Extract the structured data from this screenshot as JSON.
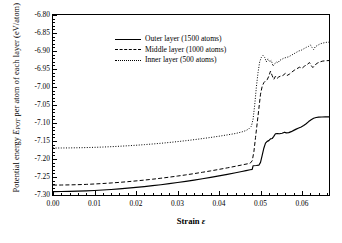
{
  "chart_data": {
    "type": "line",
    "title": "",
    "xlabel": "Strain ε",
    "ylabel": "Potential energy E_POT per atom of each layer (eV/atom)",
    "ylabel_main": "Potential energy ",
    "ylabel_sym": "E",
    "ylabel_sub": "POT",
    "ylabel_tail": " per atom of each layer (eV/atom)",
    "xlabel_main": "Strain ",
    "xlabel_sym": "ε",
    "xlim": [
      0.0,
      0.0665
    ],
    "ylim": [
      -7.3,
      -6.8
    ],
    "grid": false,
    "legend_position": "top-left",
    "x_ticks": [
      "0.00",
      "0.01",
      "0.02",
      "0.03",
      "0.04",
      "0.05",
      "0.06"
    ],
    "x_tick_values": [
      0.0,
      0.01,
      0.02,
      0.03,
      0.04,
      0.05,
      0.06
    ],
    "x_minor_step": 0.002,
    "y_ticks": [
      "-6.80",
      "-6.85",
      "-6.90",
      "-6.95",
      "-7.00",
      "-7.05",
      "-7.10",
      "-7.15",
      "-7.20",
      "-7.25",
      "-7.30"
    ],
    "y_tick_values": [
      -6.8,
      -6.85,
      -6.9,
      -6.95,
      -7.0,
      -7.05,
      -7.1,
      -7.15,
      -7.2,
      -7.25,
      -7.3
    ],
    "y_minor_step": 0.01,
    "series": [
      {
        "name": "Outer layer (1500 atoms)",
        "style": "solid",
        "color": "#000000",
        "points": [
          [
            0.0,
            -7.2905
          ],
          [
            0.002,
            -7.2903
          ],
          [
            0.004,
            -7.2899
          ],
          [
            0.006,
            -7.2893
          ],
          [
            0.008,
            -7.2885
          ],
          [
            0.01,
            -7.2874
          ],
          [
            0.012,
            -7.2861
          ],
          [
            0.014,
            -7.2846
          ],
          [
            0.016,
            -7.2829
          ],
          [
            0.018,
            -7.281
          ],
          [
            0.02,
            -7.2789
          ],
          [
            0.022,
            -7.2766
          ],
          [
            0.024,
            -7.2741
          ],
          [
            0.026,
            -7.2714
          ],
          [
            0.028,
            -7.2685
          ],
          [
            0.03,
            -7.2654
          ],
          [
            0.032,
            -7.2621
          ],
          [
            0.034,
            -7.2586
          ],
          [
            0.036,
            -7.2549
          ],
          [
            0.038,
            -7.251
          ],
          [
            0.04,
            -7.2469
          ],
          [
            0.042,
            -7.2426
          ],
          [
            0.044,
            -7.2381
          ],
          [
            0.0455,
            -7.2346
          ],
          [
            0.0465,
            -7.2322
          ],
          [
            0.0475,
            -7.2299
          ],
          [
            0.048,
            -7.2287
          ],
          [
            0.0482,
            -7.2188
          ],
          [
            0.049,
            -7.218
          ],
          [
            0.0496,
            -7.2172
          ],
          [
            0.05,
            -7.2095
          ],
          [
            0.0504,
            -7.19
          ],
          [
            0.0508,
            -7.17
          ],
          [
            0.0512,
            -7.156
          ],
          [
            0.0516,
            -7.151
          ],
          [
            0.052,
            -7.149
          ],
          [
            0.0524,
            -7.144
          ],
          [
            0.0528,
            -7.1432
          ],
          [
            0.0532,
            -7.137
          ],
          [
            0.0536,
            -7.13
          ],
          [
            0.054,
            -7.1292
          ],
          [
            0.0546,
            -7.13
          ],
          [
            0.0552,
            -7.1285
          ],
          [
            0.0558,
            -7.1255
          ],
          [
            0.0562,
            -7.1275
          ],
          [
            0.0568,
            -7.1268
          ],
          [
            0.0574,
            -7.124
          ],
          [
            0.058,
            -7.1205
          ],
          [
            0.0586,
            -7.117
          ],
          [
            0.0592,
            -7.114
          ],
          [
            0.0598,
            -7.111
          ],
          [
            0.0604,
            -7.107
          ],
          [
            0.061,
            -7.102
          ],
          [
            0.0616,
            -7.096
          ],
          [
            0.0622,
            -7.091
          ],
          [
            0.0628,
            -7.087
          ],
          [
            0.0634,
            -7.0848
          ],
          [
            0.064,
            -7.0838
          ],
          [
            0.0648,
            -7.0833
          ],
          [
            0.0656,
            -7.083
          ],
          [
            0.0665,
            -7.0828
          ]
        ]
      },
      {
        "name": "Middle layer (1000 atoms)",
        "style": "dashed",
        "color": "#000000",
        "points": [
          [
            0.0,
            -7.2725
          ],
          [
            0.002,
            -7.2723
          ],
          [
            0.004,
            -7.2719
          ],
          [
            0.006,
            -7.2713
          ],
          [
            0.008,
            -7.2705
          ],
          [
            0.01,
            -7.2694
          ],
          [
            0.012,
            -7.2681
          ],
          [
            0.014,
            -7.2666
          ],
          [
            0.016,
            -7.2649
          ],
          [
            0.018,
            -7.263
          ],
          [
            0.02,
            -7.2609
          ],
          [
            0.022,
            -7.2586
          ],
          [
            0.024,
            -7.2561
          ],
          [
            0.026,
            -7.2534
          ],
          [
            0.028,
            -7.2505
          ],
          [
            0.03,
            -7.2474
          ],
          [
            0.032,
            -7.2441
          ],
          [
            0.034,
            -7.2406
          ],
          [
            0.036,
            -7.2369
          ],
          [
            0.038,
            -7.233
          ],
          [
            0.04,
            -7.2289
          ],
          [
            0.042,
            -7.2246
          ],
          [
            0.044,
            -7.2201
          ],
          [
            0.0455,
            -7.2166
          ],
          [
            0.0465,
            -7.2142
          ],
          [
            0.0475,
            -7.2118
          ],
          [
            0.048,
            -7.205
          ],
          [
            0.0484,
            -7.18
          ],
          [
            0.0488,
            -7.14
          ],
          [
            0.0492,
            -7.1
          ],
          [
            0.0496,
            -7.06
          ],
          [
            0.05,
            -7.02
          ],
          [
            0.0504,
            -6.998
          ],
          [
            0.0508,
            -6.988
          ],
          [
            0.0512,
            -6.983
          ],
          [
            0.0516,
            -6.98
          ],
          [
            0.052,
            -6.97
          ],
          [
            0.0524,
            -6.956
          ],
          [
            0.0528,
            -6.968
          ],
          [
            0.0532,
            -6.979
          ],
          [
            0.0536,
            -6.97
          ],
          [
            0.054,
            -6.976
          ],
          [
            0.0544,
            -6.972
          ],
          [
            0.0548,
            -6.97
          ],
          [
            0.0554,
            -6.968
          ],
          [
            0.056,
            -6.962
          ],
          [
            0.0564,
            -6.968
          ],
          [
            0.057,
            -6.964
          ],
          [
            0.0576,
            -6.958
          ],
          [
            0.0582,
            -6.953
          ],
          [
            0.0588,
            -6.949
          ],
          [
            0.0594,
            -6.945
          ],
          [
            0.06,
            -6.948
          ],
          [
            0.0606,
            -6.942
          ],
          [
            0.0612,
            -6.938
          ],
          [
            0.0618,
            -6.932
          ],
          [
            0.0622,
            -6.94
          ],
          [
            0.0626,
            -6.946
          ],
          [
            0.0632,
            -6.938
          ],
          [
            0.0638,
            -6.933
          ],
          [
            0.0644,
            -6.93
          ],
          [
            0.065,
            -6.928
          ],
          [
            0.0658,
            -6.927
          ],
          [
            0.0665,
            -6.9265
          ]
        ]
      },
      {
        "name": "Inner layer (500 atoms)",
        "style": "dotted",
        "color": "#000000",
        "points": [
          [
            0.0,
            -7.1695
          ],
          [
            0.002,
            -7.1694
          ],
          [
            0.004,
            -7.1692
          ],
          [
            0.006,
            -7.1688
          ],
          [
            0.008,
            -7.1683
          ],
          [
            0.01,
            -7.1676
          ],
          [
            0.012,
            -7.1668
          ],
          [
            0.014,
            -7.1658
          ],
          [
            0.016,
            -7.1646
          ],
          [
            0.018,
            -7.1633
          ],
          [
            0.02,
            -7.1618
          ],
          [
            0.022,
            -7.1601
          ],
          [
            0.024,
            -7.1583
          ],
          [
            0.026,
            -7.1563
          ],
          [
            0.028,
            -7.1541
          ],
          [
            0.03,
            -7.1517
          ],
          [
            0.032,
            -7.1491
          ],
          [
            0.034,
            -7.1463
          ],
          [
            0.036,
            -7.1433
          ],
          [
            0.038,
            -7.1401
          ],
          [
            0.04,
            -7.1367
          ],
          [
            0.042,
            -7.133
          ],
          [
            0.044,
            -7.1291
          ],
          [
            0.0455,
            -7.1248
          ],
          [
            0.0465,
            -7.121
          ],
          [
            0.0472,
            -7.116
          ],
          [
            0.0478,
            -7.109
          ],
          [
            0.0482,
            -7.09
          ],
          [
            0.0486,
            -7.05
          ],
          [
            0.049,
            -7.0
          ],
          [
            0.0494,
            -6.96
          ],
          [
            0.0498,
            -6.93
          ],
          [
            0.0502,
            -6.918
          ],
          [
            0.0506,
            -6.912
          ],
          [
            0.051,
            -6.918
          ],
          [
            0.0514,
            -6.93
          ],
          [
            0.0518,
            -6.922
          ],
          [
            0.0522,
            -6.93
          ],
          [
            0.0526,
            -6.926
          ],
          [
            0.053,
            -6.942
          ],
          [
            0.0534,
            -6.936
          ],
          [
            0.0538,
            -6.93
          ],
          [
            0.0542,
            -6.933
          ],
          [
            0.0546,
            -6.926
          ],
          [
            0.055,
            -6.924
          ],
          [
            0.0556,
            -6.92
          ],
          [
            0.0562,
            -6.918
          ],
          [
            0.0568,
            -6.916
          ],
          [
            0.0574,
            -6.912
          ],
          [
            0.058,
            -6.908
          ],
          [
            0.0586,
            -6.904
          ],
          [
            0.0592,
            -6.9
          ],
          [
            0.0598,
            -6.898
          ],
          [
            0.0604,
            -6.894
          ],
          [
            0.061,
            -6.89
          ],
          [
            0.0616,
            -6.887
          ],
          [
            0.062,
            -6.883
          ],
          [
            0.0624,
            -6.89
          ],
          [
            0.0628,
            -6.896
          ],
          [
            0.0632,
            -6.888
          ],
          [
            0.0638,
            -6.884
          ],
          [
            0.0644,
            -6.88
          ],
          [
            0.065,
            -6.878
          ],
          [
            0.0658,
            -6.876
          ],
          [
            0.0665,
            -6.8755
          ]
        ]
      }
    ]
  },
  "legend": {
    "items": [
      {
        "label": "Outer layer (1500 atoms)",
        "style": "solid"
      },
      {
        "label": "Middle layer (1000 atoms)",
        "style": "dashed"
      },
      {
        "label": "Inner layer (500 atoms)",
        "style": "dotted"
      }
    ]
  }
}
